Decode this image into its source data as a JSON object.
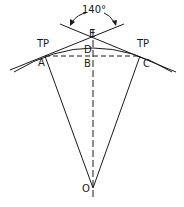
{
  "diagram": {
    "angle_label": "140°",
    "labels": {
      "tp_left": "TP",
      "tp_right": "TP",
      "a": "A",
      "b": "B",
      "c": "C",
      "d": "D",
      "e": "E",
      "o": "O"
    },
    "colors": {
      "stroke": "#1a1a1a",
      "background": "#ffffff"
    }
  }
}
